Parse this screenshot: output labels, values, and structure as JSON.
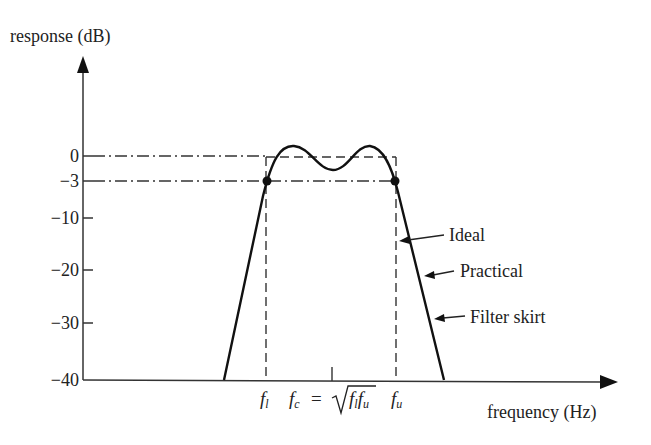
{
  "axes": {
    "y_label": "response (dB)",
    "x_label": "frequency (Hz)",
    "y_ticks": [
      {
        "label": "0",
        "value": 0,
        "y": 156
      },
      {
        "label": "−3",
        "value": -3,
        "y": 181
      },
      {
        "label": "−10",
        "value": -10,
        "y": 218
      },
      {
        "label": "−20",
        "value": -20,
        "y": 270
      },
      {
        "label": "−30",
        "value": -30,
        "y": 323
      },
      {
        "label": "−40",
        "value": -40,
        "y": 380
      }
    ]
  },
  "x_markers": {
    "fl": "f",
    "fl_sub": "l",
    "fc": "f",
    "fc_sub": "c",
    "equals": "=",
    "sqrt_f1": "f",
    "sqrt_f1_sub": "l",
    "sqrt_f2": "f",
    "sqrt_f2_sub": "u",
    "fu": "f",
    "fu_sub": "u"
  },
  "annotations": {
    "ideal": "Ideal",
    "practical": "Practical",
    "filter_skirt": "Filter skirt"
  },
  "colors": {
    "line": "#1a1a1a",
    "text": "#222222",
    "background": "#ffffff"
  }
}
